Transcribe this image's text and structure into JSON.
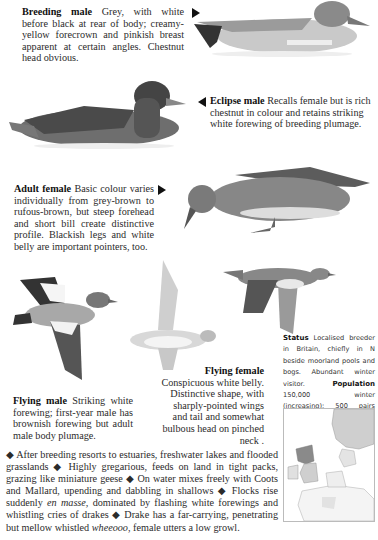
{
  "captions": {
    "breeding_male": {
      "title": "Breeding male",
      "text": "Grey, with white before black at rear of body; creamy-yellow forecrown and pinkish breast apparent at certain angles. Chestnut head obvious."
    },
    "eclipse_male": {
      "title": "Eclipse male",
      "text": "Recalls female but is rich chestnut in colour and retains striking white forewing of breeding plumage."
    },
    "adult_female": {
      "title": "Adult female",
      "text": "Basic colour varies individually from grey-brown to rufous-brown, but steep forehead and short bill create distinctive profile. Blackish legs and white belly are important pointers, too."
    },
    "flying_male": {
      "title": "Flying male",
      "text": "Striking white forewing; first-year male has brownish forewing but adult male body plumage."
    },
    "flying_female": {
      "title": "Flying female",
      "text": "Conspicuous white belly. Distinctive shape, with sharply-pointed wings and tail and somewhat bulbous head on pinched neck ."
    }
  },
  "status": {
    "status_label": "Status",
    "status_text": "Localised breeder in Britain, chiefly in N beside moorland pools and bogs. Abundant winter visitor.",
    "population_label": "Population",
    "population_text": "150,000 winter (increasing); 500 pairs breed."
  },
  "notes": {
    "bullet": "◆",
    "items": [
      "After breeding resorts to estuaries, freshwater lakes and flooded grasslands",
      "Highly gregarious, feeds on land in tight packs, grazing like miniature geese",
      "On water mixes freely with Coots and Mallard, upending and dabbling in shallows",
      "Flocks rise suddenly",
      "dominated by flashing white forewings and whistling cries of drakes",
      "Drake has a far-carrying, penetrating but mellow whistled",
      ", female utters a low growl."
    ],
    "italic_1": "en masse,",
    "italic_2": "wheeooo"
  },
  "colors": {
    "text": "#2b2b2b",
    "map_range": "#8a8a8a",
    "map_winter": "#cfcfcf"
  }
}
